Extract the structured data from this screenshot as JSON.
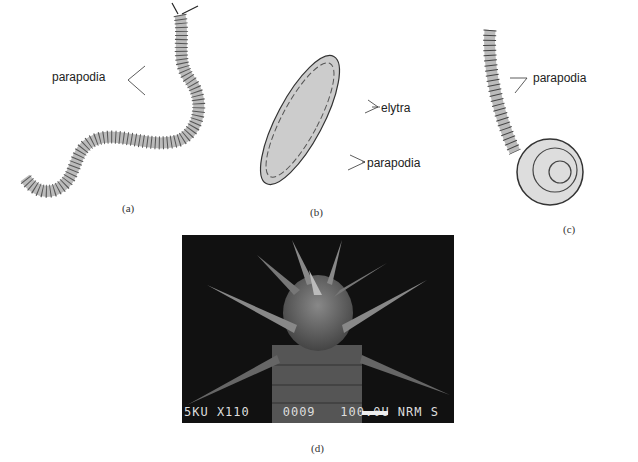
{
  "figure": {
    "panels": [
      {
        "id": "a",
        "caption": "(a)",
        "labels": [
          "parapodia"
        ],
        "description": "long wavy polychaete worm with bristly parapodia"
      },
      {
        "id": "b",
        "caption": "(b)",
        "labels": [
          "elytra",
          "parapodia"
        ],
        "description": "scale worm covered by overlapping elytra"
      },
      {
        "id": "c",
        "caption": "(c)",
        "labels": [
          "parapodia"
        ],
        "description": "coiled worm with raised anterior end"
      },
      {
        "id": "d",
        "caption": "(d)",
        "description": "scanning electron micrograph of worm head with tentacles",
        "sem_info": "5KU X110    0009   100.0U NRM S"
      }
    ]
  }
}
